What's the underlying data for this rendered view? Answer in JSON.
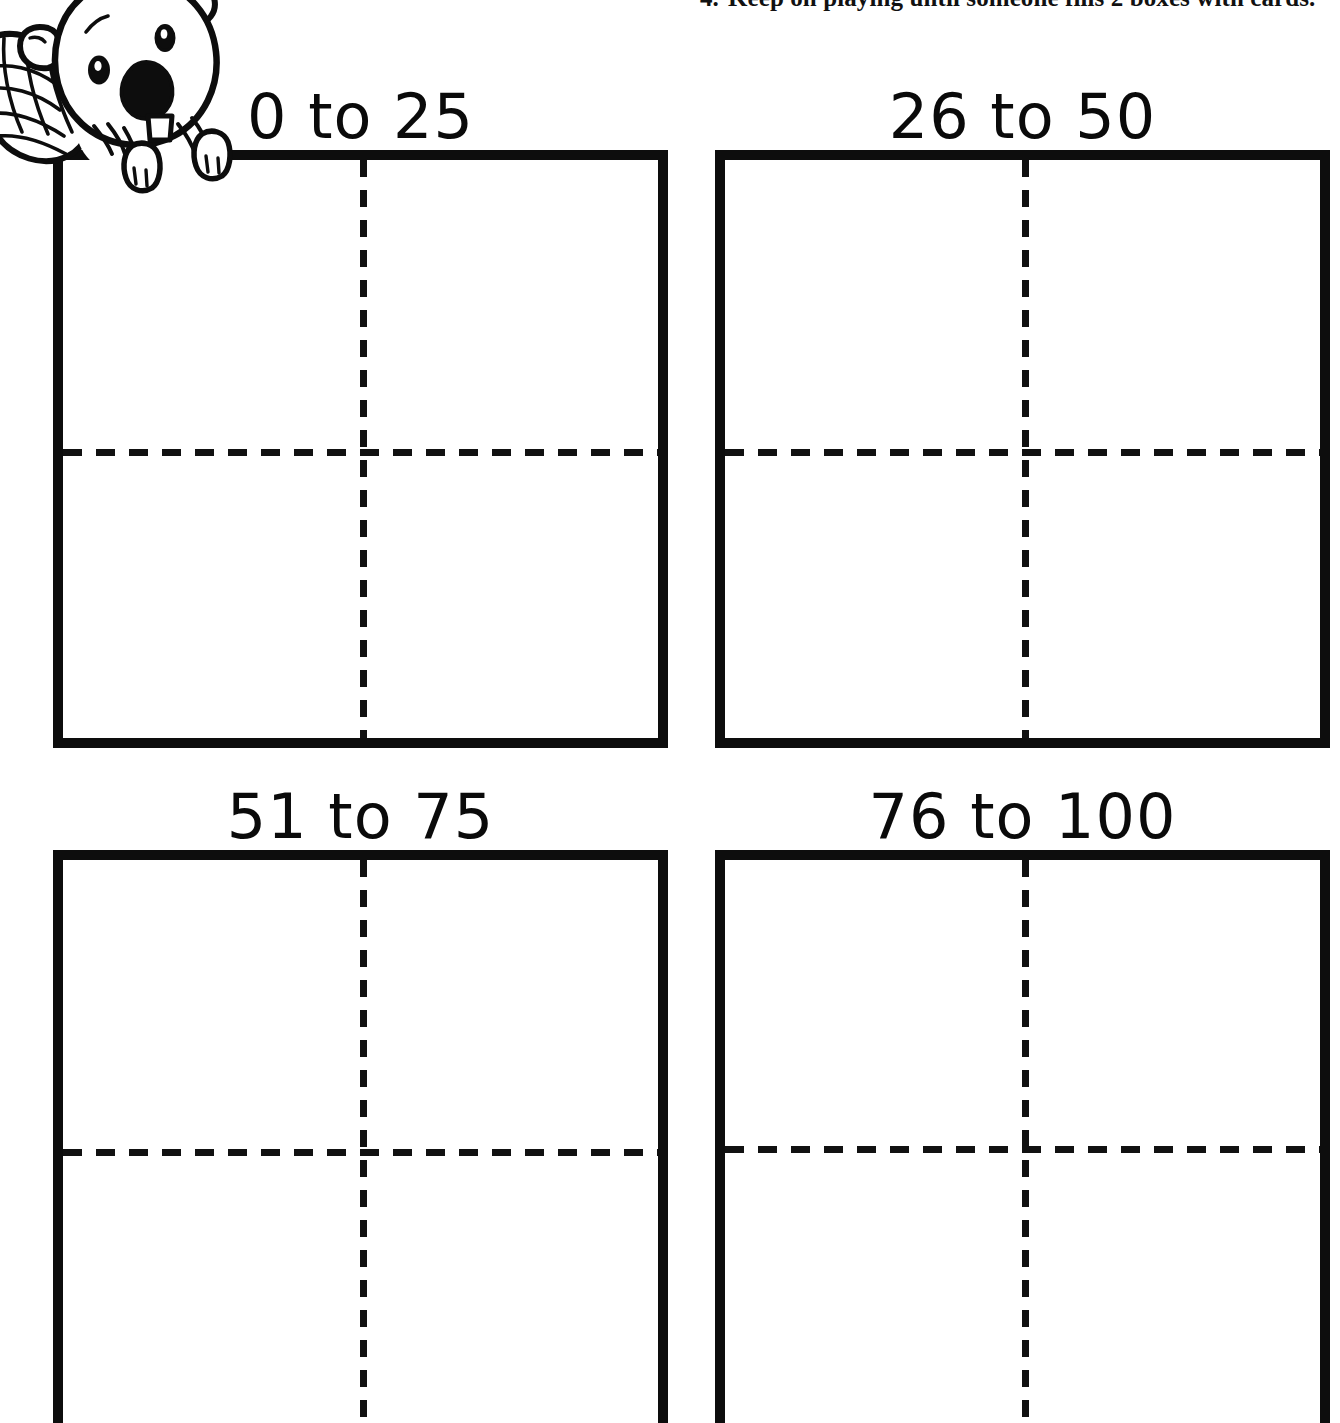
{
  "page": {
    "background_color": "#ffffff",
    "ink_color": "#0d0d0d",
    "width": 1340,
    "height": 1423
  },
  "instructions": {
    "number": "4.",
    "text": "Keep on playing until someone fills 2 boxes with cards.",
    "full_line": "4.  Keep on playing until someone fills 2 boxes with cards.",
    "clipped": "top"
  },
  "mascot": {
    "name": "beaver",
    "description": "cartoon beaver with crosshatched flat tail peeking over the first box",
    "icon": "beaver-icon"
  },
  "boxes": [
    {
      "id": "box-0-25",
      "heading": "0 to 25",
      "range_start": 0,
      "range_end": 25,
      "row": 1,
      "column": 1,
      "quadrants": 4,
      "clipped": false
    },
    {
      "id": "box-26-50",
      "heading": "26 to 50",
      "range_start": 26,
      "range_end": 50,
      "row": 1,
      "column": 2,
      "quadrants": 4,
      "clipped": false
    },
    {
      "id": "box-51-75",
      "heading": "51 to 75",
      "range_start": 51,
      "range_end": 75,
      "row": 2,
      "column": 1,
      "quadrants": 4,
      "clipped": true
    },
    {
      "id": "box-76-100",
      "heading": "76 to 100",
      "range_start": 76,
      "range_end": 100,
      "row": 2,
      "column": 2,
      "quadrants": 4,
      "clipped": true
    }
  ]
}
